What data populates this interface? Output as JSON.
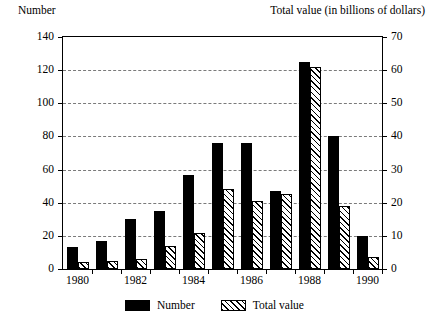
{
  "chart_data": {
    "type": "bar",
    "title": "",
    "subtitle": "",
    "left_axis_title": "Number",
    "right_axis_title": "Total value (in billions of dollars)",
    "xlabel": "",
    "categories": [
      "1980",
      "1981",
      "1982",
      "1983",
      "1984",
      "1985",
      "1986",
      "1987",
      "1988",
      "1989",
      "1990"
    ],
    "visible_tick_labels": [
      "1980",
      "1982",
      "1984",
      "1986",
      "1988",
      "1990"
    ],
    "series": [
      {
        "name": "Number",
        "axis": "left",
        "fill": "solid-black",
        "values": [
          13,
          17,
          30,
          35,
          57,
          76,
          76,
          47,
          125,
          80,
          20
        ]
      },
      {
        "name": "Total value",
        "axis": "right",
        "fill": "diagonal-hatch",
        "values": [
          2,
          2.5,
          3,
          7,
          11,
          24,
          20.5,
          22.5,
          61,
          19,
          3.5
        ]
      }
    ],
    "left_axis": {
      "ticks": [
        0,
        20,
        40,
        60,
        80,
        100,
        120,
        140
      ],
      "ylim": [
        0,
        140
      ]
    },
    "right_axis": {
      "ticks": [
        0,
        10,
        20,
        30,
        40,
        50,
        60,
        70
      ],
      "ylim": [
        0,
        70
      ]
    },
    "grid": true,
    "grid_style": "dashed-horizontal",
    "legend_position": "bottom-center",
    "legend": [
      "Number",
      "Total value"
    ],
    "colors": {
      "bar_number": "#000000",
      "bar_total_value": "#ffffff",
      "grid": "#7a7a7a",
      "axis": "#000000",
      "background": "#ffffff"
    }
  }
}
